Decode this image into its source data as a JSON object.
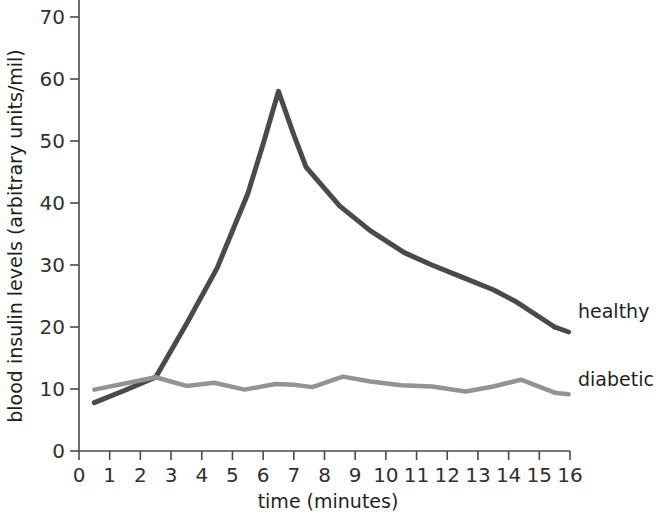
{
  "chart_data": {
    "type": "line",
    "title": "",
    "xlabel": "time (minutes)",
    "ylabel": "blood insulin levels (arbitrary units/mil)",
    "xlim": [
      0,
      16
    ],
    "ylim": [
      0,
      70
    ],
    "xticks": [
      "0",
      "1",
      "2",
      "3",
      "4",
      "5",
      "6",
      "7",
      "8",
      "9",
      "10",
      "11",
      "12",
      "13",
      "14",
      "15",
      "16"
    ],
    "yticks": [
      "0",
      "10",
      "20",
      "30",
      "40",
      "50",
      "60",
      "70"
    ],
    "grid": false,
    "legend_position": "right-inline-labels",
    "series": [
      {
        "name": "healthy",
        "color": "#4a4a4a",
        "label_x": 15.8,
        "label_y": 21.5,
        "x": [
          0.5,
          1.5,
          2.5,
          3.5,
          4.5,
          5.5,
          6.0,
          6.5,
          7.0,
          7.4,
          8.5,
          9.5,
          10.6,
          11.5,
          12.5,
          13.5,
          14.2,
          15.5
        ],
        "values": [
          7.8,
          9.8,
          11.9,
          20.5,
          29.5,
          41.5,
          49.5,
          58.0,
          51.0,
          45.8,
          39.5,
          35.5,
          32.0,
          30.0,
          28.0,
          26.0,
          24.2,
          20.0
        ]
      },
      {
        "name": "diabetic",
        "color": "#939393",
        "label_x": 15.8,
        "label_y": 10.5,
        "x": [
          0.5,
          1.5,
          2.5,
          3.5,
          4.4,
          5.4,
          6.4,
          7.0,
          7.6,
          8.6,
          9.5,
          10.5,
          11.5,
          12.6,
          13.5,
          14.4,
          15.5
        ],
        "values": [
          9.9,
          10.9,
          11.9,
          10.5,
          11.0,
          9.9,
          10.8,
          10.7,
          10.3,
          12.0,
          11.2,
          10.6,
          10.4,
          9.6,
          10.4,
          11.5,
          9.4
        ]
      }
    ]
  },
  "axes": {
    "x_title": "time (minutes)",
    "y_title": "blood insulin levels (arbitrary units/mil)"
  },
  "series_labels": {
    "healthy": "healthy",
    "diabetic": "diabetic"
  }
}
